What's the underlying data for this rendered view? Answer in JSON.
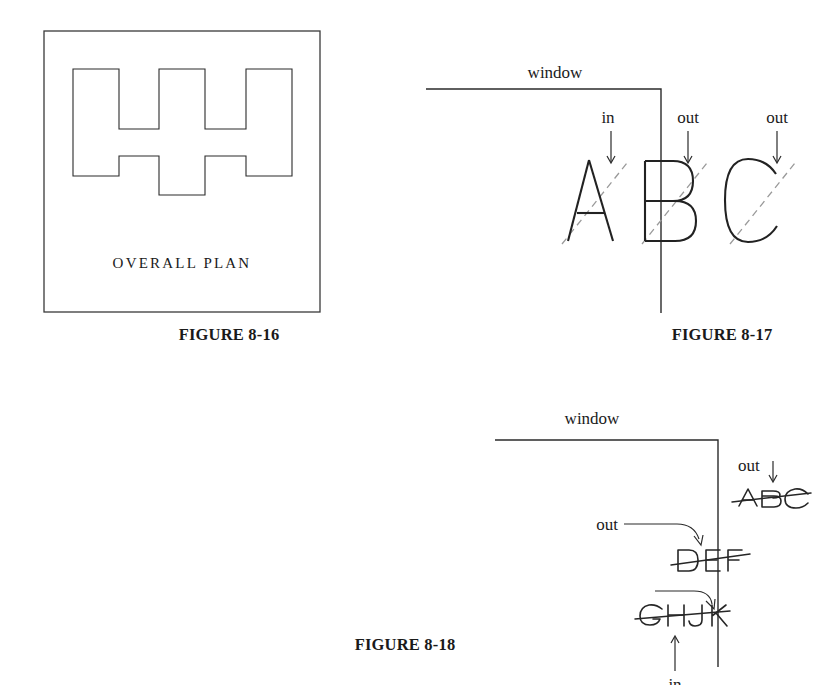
{
  "page": {
    "width": 820,
    "height": 685,
    "background": "#ffffff",
    "ink_color": "#1a1a1a",
    "dash_color": "#9a9a9a"
  },
  "figures": [
    {
      "id": "figure-8-16",
      "caption": "FIGURE 8-16",
      "inner_label": "OVERALL PLAN",
      "description": "Rectangular frame containing a castellated H-shaped outline polygon"
    },
    {
      "id": "figure-8-17",
      "caption": "FIGURE 8-17",
      "window_label": "window",
      "letters": [
        "A",
        "B",
        "C"
      ],
      "annotations": [
        {
          "label": "in",
          "target": "A"
        },
        {
          "label": "out",
          "target": "B"
        },
        {
          "label": "out",
          "target": "C"
        }
      ]
    },
    {
      "id": "figure-8-18",
      "caption": "FIGURE 8-18",
      "window_label": "window",
      "strings": [
        {
          "text": "ABC",
          "label": "out"
        },
        {
          "text": "DEF",
          "label": "out"
        },
        {
          "text": "GHJK",
          "label": "in"
        }
      ]
    }
  ]
}
